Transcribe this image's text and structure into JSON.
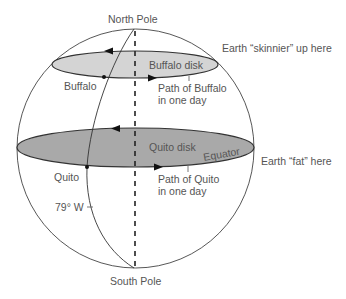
{
  "diagram": {
    "colors": {
      "background": "#ffffff",
      "buffalo_disk_fill": "#d4d4d4",
      "quito_disk_fill": "#a9a9a9",
      "line": "#333333",
      "text": "#555555"
    },
    "labels": {
      "north_pole": "North Pole",
      "south_pole": "South Pole",
      "buffalo_disk": "Buffalo disk",
      "quito_disk": "Quito disk",
      "buffalo": "Buffalo",
      "quito": "Quito",
      "equator": "Equator",
      "path_buffalo_line1": "Path of Buffalo",
      "path_buffalo_line2": "in one day",
      "path_quito_line1": "Path of Quito",
      "path_quito_line2": "in one day",
      "longitude": "79° W",
      "earth_skinnier": "Earth “skinnier” up here",
      "earth_fat": "Earth “fat” here"
    },
    "icons": {
      "rotation_arrow_west": "arrow-left-icon",
      "rotation_arrow_east": "arrow-right-icon",
      "location_marker": "dot-icon"
    }
  }
}
